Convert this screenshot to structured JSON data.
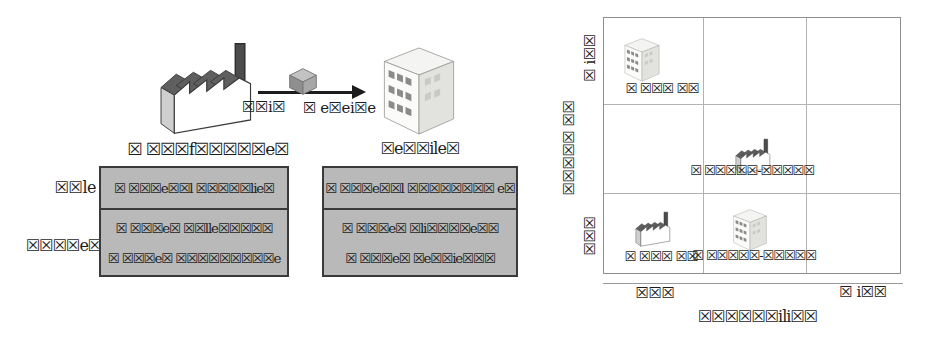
{
  "figure": {
    "left": {
      "manufacturer_caption": "☒ ☒☒☒f☒☒☒☒☒e☒",
      "retailer_caption": "☒e☒☒ile☒",
      "flow": {
        "ship": "☒☒i☒",
        "receive": "☒ e☒ei☒e"
      },
      "row_headers": {
        "role": "☒☒le",
        "process": "☒☒☒☒e☒"
      },
      "table": {
        "manufacturer": {
          "role": "☒ ☒☒☒e☒☒l ☒☒☒☒☒lie☒",
          "process": [
            "☒ ☒☒☒e☒ ☒☒lle☒☒☒☒☒",
            "☒ ☒☒☒e☒ ☒☒☒☒☒☒☒☒☒e"
          ]
        },
        "retailer": {
          "role": "☒ ☒☒☒e☒☒l ☒☒☒☒☒☒☒☒ e☒",
          "process": [
            "☒ ☒☒☒e☒ ☒li☒☒☒☒e☒☒",
            "☒ ☒☒☒e☒ ☒e☒☒ie☒☒☒"
          ]
        }
      },
      "icons": {
        "factory": "factory-icon",
        "package": "package-icon",
        "building": "building-icon"
      }
    },
    "right": {
      "grid": {
        "rows": 3,
        "cols": 3
      },
      "y_axis": {
        "top": "☒ i☒☒",
        "title": "☒☒☒☒☒ ☒☒",
        "bottom": "☒☒☒"
      },
      "x_axis": {
        "left": "☒☒☒",
        "right": "☒ i☒☒",
        "title": "☒☒☒☒☒☒ili☒☒"
      },
      "cells": [
        {
          "icon": "building-icon",
          "row": 1,
          "col": 1,
          "label": "☒ ☒☒☒ ☒☒"
        },
        {
          "icon": "factory-icon",
          "row": 2,
          "col": 2,
          "label": "☒ ☒☒☒☒☒-☒☒☒☒☒"
        },
        {
          "icon": "factory-icon",
          "row": 3,
          "col": 1,
          "label": "☒ ☒☒☒ ☒☒"
        },
        {
          "icon": "building-icon",
          "row": 3,
          "col": 2,
          "label": "☒ ☒☒☒☒☒-☒☒☒☒☒"
        }
      ]
    },
    "colors": {
      "table_fill": "#b9b9b9",
      "table_border": "#3a3a3a",
      "grid_line": "#b3b3b3",
      "arrow": "#1c1c1c"
    }
  }
}
